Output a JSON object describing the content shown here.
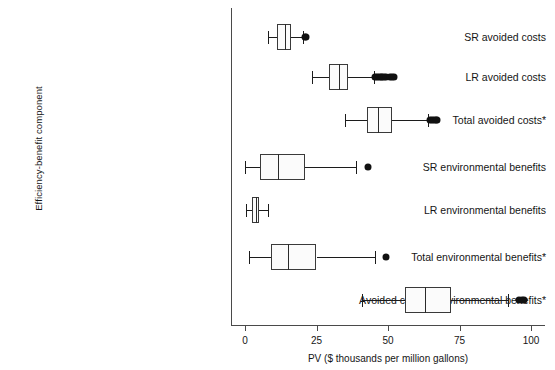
{
  "chart_data": {
    "type": "box",
    "title": "",
    "xlabel": "PV ($ thousands per million gallons)",
    "ylabel": "Efficiency-benefit component",
    "xlim": [
      0,
      100
    ],
    "xticks": [
      0,
      25,
      50,
      75,
      100
    ],
    "xtick_labels": [
      "0",
      "25",
      "50",
      "75",
      "100"
    ],
    "grid": false,
    "legend": "none",
    "orientation": "horizontal",
    "categories": [
      "SR avoided costs",
      "LR avoided costs",
      "Total avoided costs*",
      "SR environmental benefits",
      "LR environmental benefits",
      "Total environmental benefits*",
      "Avoided costs + environmental benefits*"
    ],
    "boxes": [
      {
        "label": "SR avoided costs",
        "whisker_low": 7.9,
        "q1": 11.3,
        "median": 14.0,
        "q3": 16.0,
        "whisker_high": 20.2,
        "outliers": [
          20.9,
          21.2
        ]
      },
      {
        "label": "LR avoided costs",
        "whisker_low": 23.6,
        "q1": 29.5,
        "median": 32.9,
        "q3": 36.0,
        "whisker_high": 45.2,
        "outliers": [
          45.6,
          46.2,
          46.8,
          47.4,
          48.0,
          48.6,
          49.3,
          50.6,
          51.3,
          52.0
        ]
      },
      {
        "label": "Total avoided costs*",
        "whisker_low": 35.0,
        "q1": 42.5,
        "median": 46.6,
        "q3": 51.4,
        "whisker_high": 64.0,
        "outliers": [
          64.6,
          65.3,
          66.0,
          66.7,
          67.3
        ]
      },
      {
        "label": "SR environmental benefits",
        "whisker_low": 0.0,
        "q1": 5.1,
        "median": 11.6,
        "q3": 20.9,
        "whisker_high": 38.7,
        "outliers": [
          43.0
        ]
      },
      {
        "label": "LR environmental benefits",
        "whisker_low": 0.3,
        "q1": 2.4,
        "median": 3.8,
        "q3": 4.8,
        "whisker_high": 7.9,
        "outliers": []
      },
      {
        "label": "Total environmental benefits*",
        "whisker_low": 1.4,
        "q1": 9.2,
        "median": 15.1,
        "q3": 25.0,
        "whisker_high": 45.5,
        "outliers": [
          49.3
        ]
      },
      {
        "label": "Avoided costs + environmental benefits*",
        "whisker_low": 40.8,
        "q1": 56.0,
        "median": 63.0,
        "q3": 71.9,
        "whisker_high": 92.1,
        "outliers": [
          95.8,
          96.8,
          97.4
        ]
      }
    ]
  }
}
